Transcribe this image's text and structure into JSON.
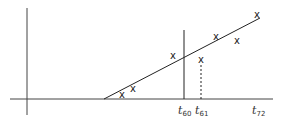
{
  "diagram": {
    "type": "regression-forecast",
    "axes": {
      "y_axis": {
        "x": 27,
        "y1": 8,
        "y2": 115
      },
      "x_axis": {
        "y": 99,
        "x1": 10,
        "x2": 273
      }
    },
    "trend_line": {
      "x1": 104,
      "y1": 99,
      "x2": 260,
      "y2": 18
    },
    "marker_glyph": "x",
    "points": [
      {
        "x": 122,
        "y": 95
      },
      {
        "x": 133,
        "y": 89
      },
      {
        "x": 173,
        "y": 56
      },
      {
        "x": 201,
        "y": 60
      },
      {
        "x": 216,
        "y": 37
      },
      {
        "x": 237,
        "y": 41
      },
      {
        "x": 257,
        "y": 15
      }
    ],
    "vertical_lines": [
      {
        "x": 184,
        "y_top": 30,
        "style": "solid"
      },
      {
        "x": 201,
        "y_top": 65,
        "style": "dashed"
      }
    ],
    "tick_labels": [
      {
        "base": "t",
        "sub": "60",
        "x": 184
      },
      {
        "base": "t",
        "sub": "61",
        "x": 201
      },
      {
        "base": "t",
        "sub": "72",
        "x": 260
      }
    ]
  }
}
